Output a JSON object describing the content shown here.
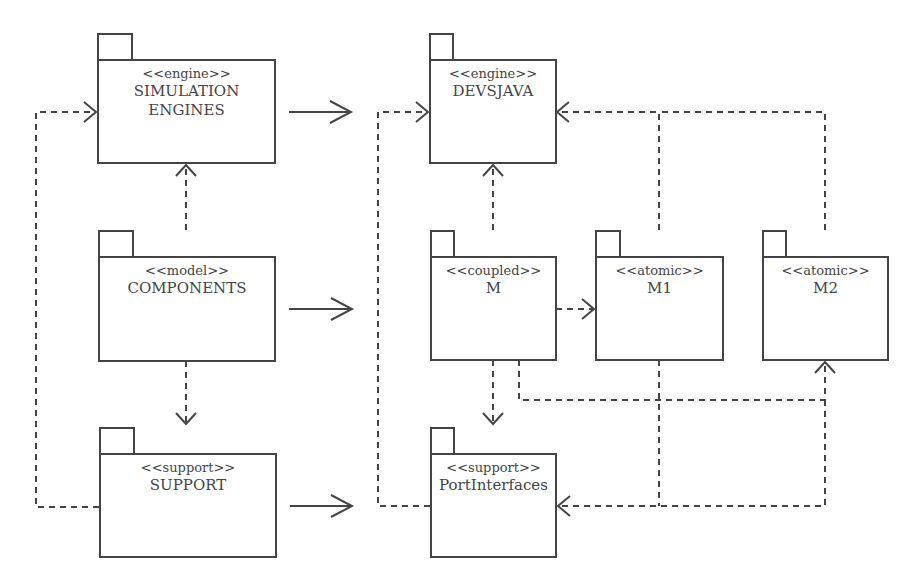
{
  "diagram": {
    "type": "UML package diagram",
    "line_color": "#444444",
    "packages": [
      {
        "id": "sim_engines",
        "stereotype": "<<engine>>",
        "name": "SIMULATION ENGINES"
      },
      {
        "id": "components",
        "stereotype": "<<model>>",
        "name": "COMPONENTS"
      },
      {
        "id": "support",
        "stereotype": "<<support>>",
        "name": "SUPPORT"
      },
      {
        "id": "devsjava",
        "stereotype": "<<engine>>",
        "name": "DEVSJAVA"
      },
      {
        "id": "m",
        "stereotype": "<<coupled>>",
        "name": "M"
      },
      {
        "id": "m1",
        "stereotype": "<<atomic>>",
        "name": "M1"
      },
      {
        "id": "m2",
        "stereotype": "<<atomic>>",
        "name": "M2"
      },
      {
        "id": "port_interfaces",
        "stereotype": "<<support>>",
        "name": "PortInterfaces"
      }
    ],
    "relations": [
      {
        "from": "components",
        "to": "sim_engines",
        "style": "dashed"
      },
      {
        "from": "components",
        "to": "support",
        "style": "dashed"
      },
      {
        "from": "support",
        "to": "sim_engines",
        "style": "dashed"
      },
      {
        "from": "sim_engines",
        "to": "devsjava",
        "style": "solid-mapping"
      },
      {
        "from": "components",
        "to": "m",
        "style": "solid-mapping"
      },
      {
        "from": "support",
        "to": "port_interfaces",
        "style": "solid-mapping"
      },
      {
        "from": "m",
        "to": "devsjava",
        "style": "dashed"
      },
      {
        "from": "m1",
        "to": "devsjava",
        "style": "dashed"
      },
      {
        "from": "m2",
        "to": "devsjava",
        "style": "dashed"
      },
      {
        "from": "m",
        "to": "m1",
        "style": "dashed"
      },
      {
        "from": "m",
        "to": "m2",
        "style": "dashed"
      },
      {
        "from": "m",
        "to": "port_interfaces",
        "style": "dashed"
      },
      {
        "from": "m1",
        "to": "port_interfaces",
        "style": "dashed"
      },
      {
        "from": "m2",
        "to": "port_interfaces",
        "style": "dashed"
      },
      {
        "from": "port_interfaces",
        "to": "devsjava",
        "style": "dashed"
      }
    ]
  }
}
